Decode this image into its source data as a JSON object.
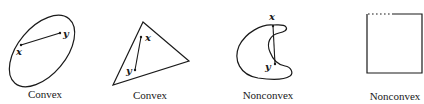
{
  "figure": {
    "panels": [
      {
        "id": "ellipse",
        "caption": "Convex",
        "point_x_label": "x",
        "point_y_label": "y"
      },
      {
        "id": "triangle",
        "caption": "Convex",
        "point_x_label": "x",
        "point_y_label": "y"
      },
      {
        "id": "crescent",
        "caption": "Nonconvex",
        "point_x_label": "x",
        "point_y_label": "y"
      },
      {
        "id": "square-partial-boundary",
        "caption": "Nonconvex"
      }
    ],
    "colors": {
      "stroke": "#1a1a1a",
      "background": "#ffffff"
    }
  }
}
